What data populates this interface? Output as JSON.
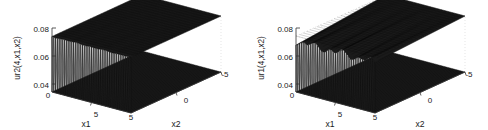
{
  "figure": {
    "background": "#ffffff",
    "width": 488,
    "height": 130,
    "panel_count": 2
  },
  "chart_data": [
    {
      "id": "left-plot",
      "type": "surface",
      "title": "",
      "zlabel": "ur2(4,x1,x2)",
      "xlabel": "x1",
      "ylabel": "x2",
      "z_ticks": [
        "0.08",
        "0.06",
        "0.04"
      ],
      "z_tick_values": [
        0.08,
        0.06,
        0.04
      ],
      "zlim": [
        0.04,
        0.085
      ],
      "x_ticks": [
        "0",
        "5"
      ],
      "x_tick_values": [
        0,
        5
      ],
      "xlim": [
        0,
        10
      ],
      "y_ticks": [
        "5",
        "0",
        "-5"
      ],
      "y_tick_values": [
        5,
        0,
        -5
      ],
      "ylim": [
        -5,
        5
      ],
      "grid": true,
      "legend": "none",
      "description": "Flat upper surface near 0.08 with dense vertical mesh ribs descending to a flat dark base at 0.04; nearly uniform plateau.",
      "surface_color": "#161616",
      "rib_count": 44,
      "rib_irregularity": 0.06
    },
    {
      "id": "right-plot",
      "type": "surface",
      "title": "",
      "zlabel": "ur1(4,x1,x2)",
      "xlabel": "x1",
      "ylabel": "x2",
      "z_ticks": [
        "0.08",
        "0.06",
        "0.04"
      ],
      "z_tick_values": [
        0.08,
        0.06,
        0.04
      ],
      "zlim": [
        0.04,
        0.085
      ],
      "x_ticks": [
        "0",
        "5"
      ],
      "x_tick_values": [
        0,
        5
      ],
      "xlim": [
        0,
        10
      ],
      "y_ticks": [
        "5",
        "0",
        "-5"
      ],
      "y_tick_values": [
        5,
        0,
        -5
      ],
      "ylim": [
        -5,
        5
      ],
      "grid": true,
      "legend": "none",
      "description": "Upper surface near 0.08 with a wavy undulating edge; vertical mesh ribs cross irregularly, producing zig-zag banding down to the dark base at 0.04.",
      "surface_color": "#161616",
      "rib_count": 44,
      "rib_irregularity": 0.55
    }
  ],
  "panels": [
    {
      "key": "left",
      "zlabel": "ur2(4,x1,x2)",
      "xlabel": "x1",
      "ylabel": "x2",
      "ticks": {
        "z0": "0.08",
        "z1": "0.06",
        "z2": "0.04",
        "x0": "0",
        "x1": "5",
        "y0": "5",
        "y1": "0",
        "y2": "-5"
      }
    },
    {
      "key": "right",
      "zlabel": "ur1(4,x1,x2)",
      "xlabel": "x1",
      "ylabel": "x2",
      "ticks": {
        "z0": "0.08",
        "z1": "0.06",
        "z2": "0.04",
        "x0": "0",
        "x1": "5",
        "y0": "5",
        "y1": "0",
        "y2": "-5"
      }
    }
  ]
}
